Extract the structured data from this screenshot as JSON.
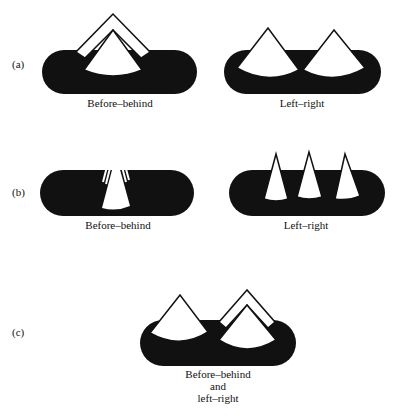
{
  "rows": [
    {
      "id": "a",
      "row_label": "(a)",
      "panels": [
        {
          "caption": "Before–behind",
          "cones": 2,
          "arrangement": "nested-front-back"
        },
        {
          "caption": "Left–right",
          "cones": 2,
          "arrangement": "side-by-side"
        }
      ]
    },
    {
      "id": "b",
      "row_label": "(b)",
      "panels": [
        {
          "caption": "Before–behind",
          "cones": 3,
          "arrangement": "nested-front-back"
        },
        {
          "caption": "Left–right",
          "cones": 3,
          "arrangement": "side-by-side"
        }
      ]
    },
    {
      "id": "c",
      "row_label": "(c)",
      "panels": [
        {
          "caption_lines": [
            "Before–behind",
            "and",
            "left–right"
          ],
          "cones": 3,
          "arrangement": "combined"
        }
      ]
    }
  ],
  "colors": {
    "ink": "#111111",
    "paper": "#ffffff"
  }
}
